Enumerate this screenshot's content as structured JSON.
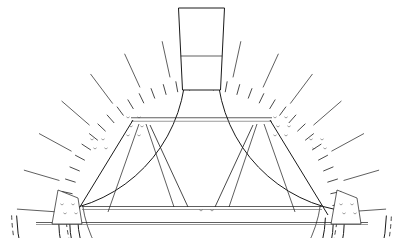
{
  "figure": {
    "name": "arch-centering-drawing",
    "type": "line-drawing",
    "width": 403,
    "height": 238,
    "background_color": "#ffffff",
    "line_color": "#1a1a1a",
    "faint_line_color": "#6f6f6f"
  },
  "geometry": {
    "center_x": 201.5,
    "center_y": 222.0,
    "springing_y": 222.0,
    "radii": {
      "extrados_dashed": 190.0,
      "extrados_solid": 185.0,
      "voussoir_inner": 148.0,
      "ring_outer_band": 143.0,
      "ring_dashed": 136.0,
      "lagging_outer": 132.0,
      "intrados": 124.0,
      "truss_outer": 120.0
    },
    "voussoir_count": 14,
    "voussoir_span_degrees": [
      4,
      176
    ],
    "lagging_count": 34,
    "keystone": {
      "half_angle_deg": 6.2,
      "top_width": 46,
      "bottom_width": 38,
      "top_y": 8,
      "shoulder_y": 56,
      "base_y": 90
    }
  },
  "truss": {
    "collar_beam": {
      "y": 119.5,
      "x1": 131,
      "x2": 272,
      "thickness": 3.5
    },
    "tie_beam_upper": {
      "y": 208.0,
      "x1": 82,
      "x2": 322,
      "thickness": 3.0
    },
    "tie_beam_lower": {
      "y": 223.5,
      "x1": 36,
      "x2": 368,
      "thickness": 2.0
    },
    "principal_rafters": [
      {
        "name": "left-rafter",
        "x1": 75,
        "y1": 215,
        "x2": 133,
        "y2": 120
      },
      {
        "name": "right-rafter",
        "x1": 328,
        "y1": 215,
        "x2": 270,
        "y2": 120
      }
    ],
    "struts": [
      {
        "name": "left-outer-strut",
        "x1": 108,
        "y1": 212,
        "x2": 139,
        "y2": 124
      },
      {
        "name": "left-inner-strut",
        "x1": 174,
        "y1": 207,
        "x2": 146,
        "y2": 124
      },
      {
        "name": "right-inner-strut",
        "x1": 229,
        "y1": 207,
        "x2": 257,
        "y2": 124
      },
      {
        "name": "right-outer-strut",
        "x1": 295,
        "y1": 212,
        "x2": 264,
        "y2": 124
      }
    ],
    "king_posts": [
      {
        "name": "left-king-post",
        "x1": 188,
        "y1": 207,
        "x2": 150,
        "y2": 125
      },
      {
        "name": "right-king-post",
        "x1": 215,
        "y1": 207,
        "x2": 253,
        "y2": 125
      }
    ],
    "bearing_blocks": [
      {
        "name": "left-shoe",
        "x": 62,
        "y": 196
      },
      {
        "name": "right-shoe",
        "x": 341,
        "y": 196
      }
    ]
  },
  "bolt_clusters": [
    {
      "name": "left-crown-bolts",
      "cx": 128,
      "cy": 118,
      "count": 6
    },
    {
      "name": "right-crown-bolts",
      "cx": 275,
      "cy": 118,
      "count": 6
    },
    {
      "name": "left-shoulder-bolts",
      "cx": 92,
      "cy": 140,
      "count": 4
    },
    {
      "name": "right-shoulder-bolts",
      "cx": 311,
      "cy": 140,
      "count": 4
    },
    {
      "name": "left-springing-bolts",
      "cx": 62,
      "cy": 205,
      "count": 4
    },
    {
      "name": "right-springing-bolts",
      "cx": 341,
      "cy": 205,
      "count": 4
    },
    {
      "name": "center-tie-bolts",
      "cx": 201,
      "cy": 211,
      "count": 2
    }
  ],
  "annotations": {
    "caption": "",
    "labels": []
  }
}
